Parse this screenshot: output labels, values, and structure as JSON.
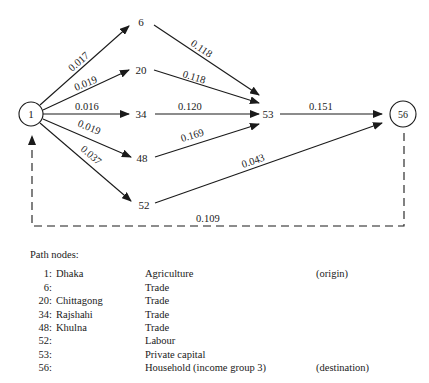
{
  "nodes": [
    {
      "id": "1",
      "x": 31,
      "y": 114,
      "circled": true
    },
    {
      "id": "6",
      "x": 141,
      "y": 22
    },
    {
      "id": "20",
      "x": 141,
      "y": 70
    },
    {
      "id": "34",
      "x": 141,
      "y": 114
    },
    {
      "id": "48",
      "x": 141,
      "y": 158
    },
    {
      "id": "52",
      "x": 144,
      "y": 205
    },
    {
      "id": "53",
      "x": 267,
      "y": 114
    },
    {
      "id": "56",
      "x": 403,
      "y": 114,
      "circled": true
    }
  ],
  "edges": [
    {
      "from": "1",
      "to": "6",
      "label": "0.017"
    },
    {
      "from": "1",
      "to": "20",
      "label": "0.019"
    },
    {
      "from": "1",
      "to": "34",
      "label": "0.016"
    },
    {
      "from": "1",
      "to": "48",
      "label": "0.019"
    },
    {
      "from": "1",
      "to": "52",
      "label": "0.037"
    },
    {
      "from": "6",
      "to": "53",
      "label": "0.118"
    },
    {
      "from": "20",
      "to": "53",
      "label": "0.118"
    },
    {
      "from": "34",
      "to": "53",
      "label": "0.120"
    },
    {
      "from": "48",
      "to": "53",
      "label": "0.169"
    },
    {
      "from": "53",
      "to": "56",
      "label": "0.151"
    },
    {
      "from": "52",
      "to": "56",
      "label": "0.043"
    },
    {
      "from": "56",
      "to": "1",
      "label": "0.109",
      "dashed": true
    }
  ],
  "legend": {
    "title": "Path nodes:",
    "rows": [
      {
        "num": "1:",
        "city": "Dhaka",
        "sector": "Agriculture",
        "role": "(origin)"
      },
      {
        "num": "6:",
        "city": "",
        "sector": "Trade",
        "role": ""
      },
      {
        "num": "20:",
        "city": "Chittagong",
        "sector": "Trade",
        "role": ""
      },
      {
        "num": "34:",
        "city": "Rajshahi",
        "sector": "Trade",
        "role": ""
      },
      {
        "num": "48:",
        "city": "Khulna",
        "sector": "Trade",
        "role": ""
      },
      {
        "num": "52:",
        "city": "",
        "sector": "Labour",
        "role": ""
      },
      {
        "num": "53:",
        "city": "",
        "sector": "Private capital",
        "role": ""
      },
      {
        "num": "56:",
        "city": "",
        "sector": "Household (income group 3)",
        "role": "(destination)"
      }
    ]
  }
}
